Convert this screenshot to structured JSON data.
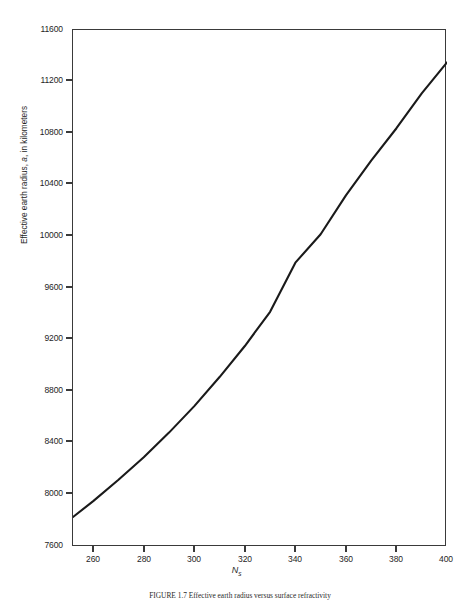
{
  "figure": {
    "caption": "FIGURE 1.7  Effective earth radius versus surface refractivity",
    "caption_label": "FIGURE 1.7"
  },
  "axes": {
    "y_title_pre": "Effective earth radius, ",
    "y_title_symbol": "a",
    "y_title_post": ", in kilometers",
    "x_title_symbol": "N",
    "x_title_subscript": "s",
    "y_ticks": [
      "11600",
      "11200",
      "10800",
      "10400",
      "10000",
      "9600",
      "9200",
      "8800",
      "8400",
      "8000",
      "7600"
    ],
    "x_ticks": [
      "260",
      "280",
      "300",
      "320",
      "340",
      "360",
      "380",
      "400"
    ],
    "frame_color": "#3a3a3a",
    "curve_color": "#1a1a1a"
  },
  "chart_data": {
    "type": "line",
    "title": "",
    "xlabel": "Ns",
    "ylabel": "Effective earth radius, a, in kilometers",
    "xlim": [
      252,
      400
    ],
    "ylim": [
      7600,
      11600
    ],
    "grid": false,
    "legend": "none",
    "x_tick_values": [
      260,
      280,
      300,
      320,
      340,
      360,
      380,
      400
    ],
    "y_tick_values": [
      7600,
      8000,
      8400,
      8800,
      9200,
      9600,
      10000,
      10400,
      10800,
      11200,
      11600
    ],
    "series": [
      {
        "name": "Effective earth radius",
        "x": [
          252,
          260,
          270,
          280,
          290,
          300,
          310,
          320,
          330,
          340,
          350,
          360,
          370,
          380,
          390,
          400
        ],
        "values": [
          7832,
          7955,
          8120,
          8295,
          8485,
          8690,
          8915,
          9155,
          9420,
          9800,
          10020,
          10320,
          10590,
          10840,
          11110,
          11350
        ]
      }
    ]
  }
}
